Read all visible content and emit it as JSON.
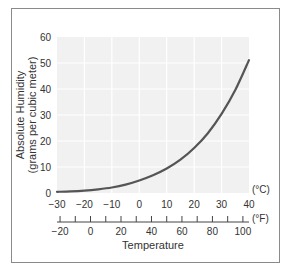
{
  "chart_data": {
    "type": "line",
    "title": "",
    "xlabel": "Temperature",
    "ylabel": "Absolute Humidity (grams per cubic meter)",
    "ylabel_line1": "Absolute Humidity",
    "ylabel_line2": "(grams per cubic meter)",
    "x_unit_primary": "(°C)",
    "x_unit_secondary": "(°F)",
    "xlim": [
      -30,
      40
    ],
    "ylim": [
      0,
      60
    ],
    "grid": true,
    "legend": null,
    "x_ticks_c": [
      -30,
      -20,
      -10,
      0,
      10,
      20,
      30,
      40
    ],
    "x_ticks_f_labeled": [
      -20,
      0,
      20,
      40,
      60,
      80,
      100
    ],
    "x_ticks_f_minor_step": 10,
    "y_ticks": [
      0,
      10,
      20,
      30,
      40,
      50,
      60
    ],
    "series": [
      {
        "name": "Saturation absolute humidity",
        "x": [
          -30,
          -25,
          -20,
          -15,
          -10,
          -5,
          0,
          5,
          10,
          15,
          20,
          25,
          30,
          35,
          40
        ],
        "values": [
          0.45,
          0.6,
          0.9,
          1.4,
          2.1,
          3.2,
          4.8,
          6.8,
          9.4,
          12.8,
          17.3,
          23.0,
          30.4,
          39.6,
          51.1
        ]
      }
    ]
  },
  "colors": {
    "plot_bg": "#f1f1f1",
    "grid": "#ffffff",
    "curve": "#555555",
    "frame": "#8a8a8a",
    "text": "#333333"
  }
}
